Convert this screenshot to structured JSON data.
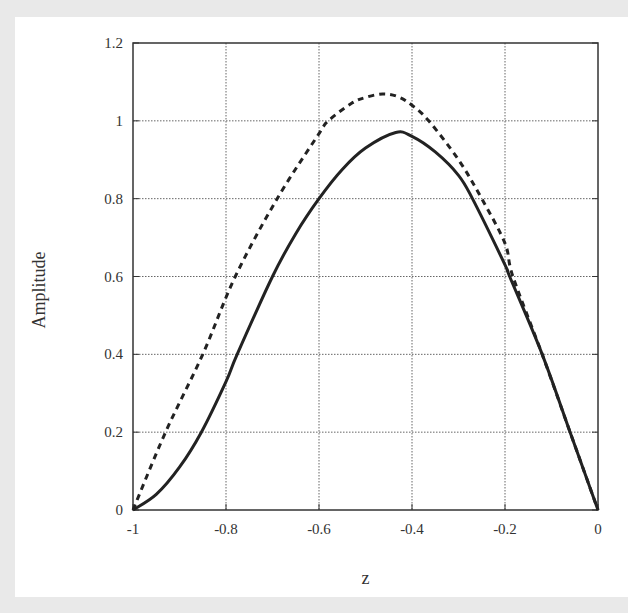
{
  "chart_data": {
    "type": "line",
    "title": "",
    "xlabel": "z",
    "ylabel": "Amplitude",
    "xlim": [
      -1,
      0
    ],
    "ylim": [
      0,
      1.2
    ],
    "grid": true,
    "legend": null,
    "xticks": [
      -1,
      -0.8,
      -0.6,
      -0.4,
      -0.2,
      0
    ],
    "xtick_labels": [
      "-1",
      "-0.8",
      "-0.6",
      "-0.4",
      "-0.2",
      "0"
    ],
    "yticks": [
      0,
      0.2,
      0.4,
      0.6,
      0.8,
      1,
      1.2
    ],
    "ytick_labels": [
      "0",
      "0.2",
      "0.4",
      "0.6",
      "0.8",
      "1",
      "1.2"
    ],
    "series": [
      {
        "name": "solid",
        "style": "solid",
        "color": "#222222",
        "x": [
          -1,
          -0.95,
          -0.9,
          -0.853,
          -0.8,
          -0.776,
          -0.7,
          -0.65,
          -0.6,
          -0.55,
          -0.5,
          -0.435,
          -0.4,
          -0.35,
          -0.3,
          -0.27,
          -0.2,
          -0.19,
          -0.12,
          -0.06,
          0
        ],
        "y": [
          0,
          0.04,
          0.11,
          0.2,
          0.33,
          0.4,
          0.6,
          0.71,
          0.8,
          0.875,
          0.93,
          0.97,
          0.96,
          0.92,
          0.86,
          0.8,
          0.63,
          0.6,
          0.4,
          0.2,
          0
        ]
      },
      {
        "name": "dashed",
        "style": "dashed",
        "color": "#222222",
        "x": [
          -1,
          -0.93,
          -0.85,
          -0.78,
          -0.69,
          -0.6,
          -0.58,
          -0.53,
          -0.5,
          -0.463,
          -0.43,
          -0.4,
          -0.364,
          -0.3,
          -0.25,
          -0.2,
          -0.183,
          -0.12,
          -0.06,
          0
        ],
        "y": [
          0,
          0.2,
          0.4,
          0.6,
          0.8,
          0.967,
          1.0,
          1.045,
          1.06,
          1.069,
          1.062,
          1.04,
          1.0,
          0.9,
          0.8,
          0.685,
          0.6,
          0.4,
          0.2,
          0
        ]
      }
    ]
  }
}
